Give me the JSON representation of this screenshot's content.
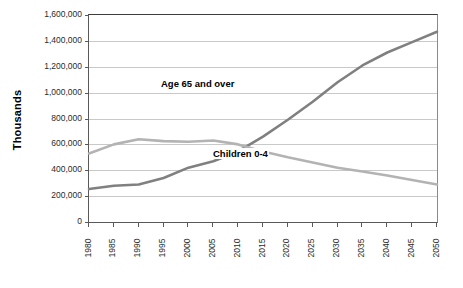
{
  "chart_data": {
    "type": "line",
    "title": "",
    "xlabel": "",
    "ylabel": "Thousands",
    "ylim": [
      0,
      1600000
    ],
    "grid": true,
    "legend_position": "inline-annotation",
    "categories": [
      "1980",
      "1985",
      "1990",
      "1995",
      "2000",
      "2005",
      "2010",
      "2015",
      "2020",
      "2025",
      "2030",
      "2035",
      "2040",
      "2045",
      "2050"
    ],
    "y_ticks": [
      "0",
      "200,000",
      "400,000",
      "600,000",
      "800,000",
      "1,000,000",
      "1,200,000",
      "1,400,000",
      "1,600,000"
    ],
    "y_tick_values": [
      0,
      200000,
      400000,
      600000,
      800000,
      1000000,
      1200000,
      1400000,
      1600000
    ],
    "series": [
      {
        "name": "Age 65 and over",
        "color": "#808080",
        "values": [
          255000,
          280000,
          290000,
          340000,
          420000,
          470000,
          545000,
          660000,
          790000,
          930000,
          1080000,
          1210000,
          1310000,
          1390000,
          1470000
        ]
      },
      {
        "name": "Children 0-4",
        "color": "#b3b3b3",
        "values": [
          530000,
          600000,
          640000,
          625000,
          620000,
          630000,
          600000,
          545000,
          500000,
          460000,
          420000,
          390000,
          360000,
          325000,
          290000
        ]
      }
    ],
    "annotations": [
      {
        "text": "Age 65 and over",
        "series": "Age 65 and over"
      },
      {
        "text": "Children 0-4",
        "series": "Children 0-4"
      }
    ]
  }
}
